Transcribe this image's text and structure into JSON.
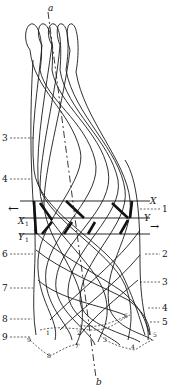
{
  "figure": {
    "axis_top_label": "a",
    "axis_bottom_label": "b",
    "left_labels": [
      "3",
      "4",
      "6",
      "7",
      "8",
      "9"
    ],
    "right_labels": [
      "1",
      "2",
      "3",
      "4",
      "5"
    ],
    "band_labels": {
      "X": "X",
      "Y": "Y",
      "X1": "X",
      "X1_sub": "1",
      "Y1": "Y",
      "Y1_sub": "1"
    },
    "arrows": {
      "left": "←",
      "right": "→"
    },
    "bottom_point_labels": [
      "1",
      "2",
      "3",
      "4",
      "5",
      "6",
      "7",
      "8",
      "9"
    ]
  }
}
